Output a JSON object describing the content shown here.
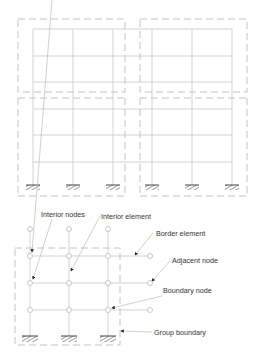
{
  "top_figure": {
    "description": "Two-bay-group frame structure partitioned into four dashed subdomain groups",
    "columns_x": [
      33,
      73,
      113,
      152,
      192,
      232
    ],
    "floors_y": [
      29,
      56,
      82,
      109,
      135,
      162
    ],
    "ground_y": 185,
    "supports_count": 6
  },
  "bottom_figure": {
    "labels": {
      "interior_nodes": "Interior nodes",
      "interior_element": "Interior element",
      "border_element": "Border element",
      "adjacent_node": "Adjacent node",
      "boundary_node": "Boundary node",
      "group_boundary": "Group boundary"
    },
    "columns_x": [
      30,
      69,
      108
    ],
    "node_rows_y": [
      229,
      256,
      283,
      310
    ],
    "adjacent_nodes_x": 150,
    "supports_count": 3
  },
  "colors": {
    "frame_line": "#c8c8c8",
    "dashed_boundary": "#bdbdbd",
    "text": "#333333",
    "arrow": "#222222"
  }
}
